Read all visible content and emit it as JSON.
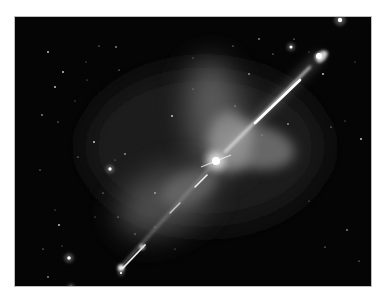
{
  "image": {
    "subject": "bipolar jet from young star with surrounding nebula and star field",
    "frame": {
      "x": 15,
      "y": 17,
      "width": 356,
      "height": 269
    },
    "colors": {
      "background": "#ffffff",
      "sky": "#050505",
      "nebula": "#8a8a8a",
      "jet": "#f2f2f2",
      "stars": "#ffffff"
    },
    "stars": [
      [
        33,
        35
      ],
      [
        71,
        45
      ],
      [
        84,
        29
      ],
      [
        101,
        30
      ],
      [
        104,
        53
      ],
      [
        72,
        63
      ],
      [
        40,
        70
      ],
      [
        178,
        41
      ],
      [
        218,
        29
      ],
      [
        244,
        22
      ],
      [
        279,
        22
      ],
      [
        294,
        35
      ],
      [
        308,
        57
      ],
      [
        340,
        45
      ],
      [
        360,
        37
      ],
      [
        27,
        98
      ],
      [
        43,
        105
      ],
      [
        60,
        84
      ],
      [
        79,
        125
      ],
      [
        100,
        143
      ],
      [
        63,
        140
      ],
      [
        110,
        137
      ],
      [
        25,
        153
      ],
      [
        40,
        193
      ],
      [
        44,
        208
      ],
      [
        47,
        229
      ],
      [
        28,
        232
      ],
      [
        33,
        260
      ],
      [
        103,
        200
      ],
      [
        80,
        200
      ],
      [
        157,
        99
      ],
      [
        178,
        72
      ],
      [
        220,
        89
      ],
      [
        273,
        107
      ],
      [
        316,
        110
      ],
      [
        330,
        104
      ],
      [
        346,
        122
      ],
      [
        294,
        184
      ],
      [
        310,
        230
      ],
      [
        332,
        213
      ],
      [
        344,
        244
      ],
      [
        365,
        210
      ],
      [
        357,
        170
      ],
      [
        247,
        118
      ],
      [
        198,
        145
      ],
      [
        140,
        176
      ],
      [
        120,
        217
      ],
      [
        160,
        232
      ],
      [
        48,
        55
      ],
      [
        140,
        210
      ],
      [
        88,
        176
      ],
      [
        234,
        57
      ],
      [
        258,
        37
      ]
    ],
    "bright_stars": [
      [
        95,
        152,
        2.4
      ],
      [
        54,
        241,
        2.6
      ],
      [
        276,
        30,
        2.2
      ],
      [
        325,
        3,
        3.2
      ],
      [
        56,
        270,
        1.8
      ],
      [
        106,
        256,
        1.6
      ]
    ]
  }
}
